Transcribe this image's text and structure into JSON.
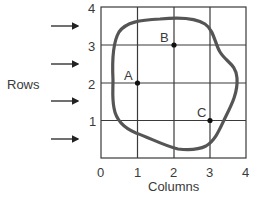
{
  "diagram": {
    "axis_labels": {
      "x": "Columns",
      "y": "Rows"
    },
    "x_ticks": [
      "0",
      "1",
      "2",
      "3",
      "4"
    ],
    "y_ticks": [
      "1",
      "2",
      "3",
      "4"
    ],
    "grid": {
      "columns": 4,
      "rows": 4
    },
    "points": [
      {
        "label": "A",
        "col": 1,
        "row": 2
      },
      {
        "label": "B",
        "col": 2,
        "row": 3
      },
      {
        "label": "C",
        "col": 3,
        "row": 1
      }
    ],
    "row_arrows": 4,
    "colors": {
      "grid": "#333333",
      "outline": "#555555",
      "point": "#111111"
    }
  }
}
